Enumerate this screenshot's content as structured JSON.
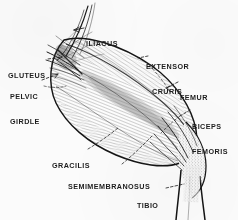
{
  "figure": {
    "background_color": "#fbfbfb",
    "ink_color": "#1d1d1d",
    "width": 238,
    "height": 220
  },
  "labels": [
    {
      "id": "iliacus",
      "name": "ILIACUS",
      "lines": [
        "ILIACUS"
      ],
      "x": 86,
      "y": 24,
      "leader": "arrow-left"
    },
    {
      "id": "gluteus",
      "name": "GLUTEUS",
      "lines": [
        "GLUTEUS"
      ],
      "x": 8,
      "y": 56,
      "leader": "dashed-right"
    },
    {
      "id": "extensor-cruris",
      "name": "EXTENSOR CRURIS",
      "lines": [
        "EXTENSOR",
        "CRURIS"
      ],
      "x": 146,
      "y": 46,
      "leader": "dashed-down-left"
    },
    {
      "id": "pelvic-girdle",
      "name": "PELVIC GIRDLE",
      "lines": [
        "PELVIC",
        "GIRDLE"
      ],
      "x": 10,
      "y": 76,
      "leader": "arrow-up-right"
    },
    {
      "id": "femur",
      "name": "FEMUR",
      "lines": [
        "FEMUR"
      ],
      "x": 180,
      "y": 78,
      "leader": "dashed-down-left"
    },
    {
      "id": "biceps-femoris",
      "name": "BICEPS FEMORIS",
      "lines": [
        "BICEPS",
        "FEMORIS"
      ],
      "x": 192,
      "y": 106,
      "leader": "dashed-down-left"
    },
    {
      "id": "gracilis",
      "name": "GRACILIS",
      "lines": [
        "GRACILIS"
      ],
      "x": 52,
      "y": 146,
      "leader": "dashed-up-right"
    },
    {
      "id": "semimembranosus",
      "name": "SEMIMEMBRANOSUS",
      "lines": [
        "SEMIMEMBRANOSUS"
      ],
      "x": 68,
      "y": 167,
      "leader": "dashed-up-right"
    },
    {
      "id": "tibio-fibula",
      "name": "TIBIO FIBULA",
      "lines": [
        "TIBIO",
        "FIBULA"
      ],
      "x": 137,
      "y": 185,
      "leader": "dashed-right"
    }
  ]
}
